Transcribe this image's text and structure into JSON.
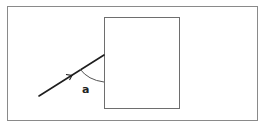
{
  "diagram": {
    "colors": {
      "background": "#ffffff",
      "frame": "#8a8a8a",
      "block": "#6e6e6e",
      "ray": "#1e1e1e",
      "arc": "#555555",
      "label": "#222222"
    },
    "frame": {
      "x": 7,
      "y": 6,
      "width": 250,
      "height": 115
    },
    "block": {
      "x": 104,
      "y": 17,
      "width": 75,
      "height": 91
    },
    "ray": {
      "x1": 39,
      "y1": 96,
      "x2": 104,
      "y2": 55,
      "arrow_at": [
        70,
        76
      ]
    },
    "angle": {
      "label": "a",
      "arc_from": [
        80,
        69
      ],
      "arc_to": [
        104,
        82
      ],
      "label_pos": [
        82,
        93
      ]
    }
  }
}
